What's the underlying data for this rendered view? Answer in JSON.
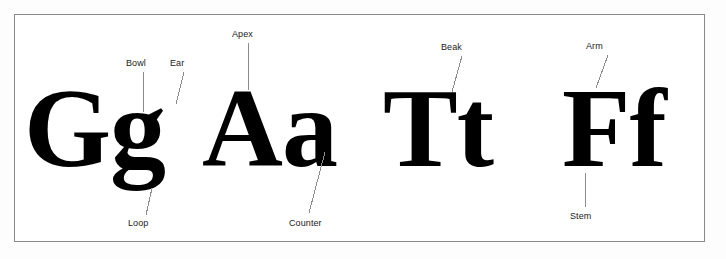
{
  "diagram": {
    "background_color": "#ffffff",
    "frame_color": "#8a8a8a",
    "glyph_color": "#000000",
    "label_color": "#1a1a1a",
    "leader_line_color": "#8c8c8c",
    "typeface_style": "bold serif"
  },
  "glyph_pairs": [
    {
      "name": "pair-gg",
      "text": "Gg",
      "left": 24,
      "baseline": 172,
      "size": 112
    },
    {
      "name": "pair-aa",
      "text": "Aa",
      "left": 202,
      "baseline": 172,
      "size": 112
    },
    {
      "name": "pair-tt",
      "text": "Tt",
      "left": 383,
      "baseline": 172,
      "size": 112
    },
    {
      "name": "pair-ff",
      "text": "Ff",
      "left": 562,
      "baseline": 172,
      "size": 112
    }
  ],
  "callouts": [
    {
      "name": "bowl",
      "label": "Bowl",
      "label_x": 126,
      "label_y": 58,
      "line": {
        "x1": 143,
        "y1": 72,
        "x2": 143,
        "y2": 112
      }
    },
    {
      "name": "ear",
      "label": "Ear",
      "label_x": 170,
      "label_y": 58,
      "line": {
        "x1": 184,
        "y1": 72,
        "x2": 176,
        "y2": 104
      }
    },
    {
      "name": "apex",
      "label": "Apex",
      "label_x": 232,
      "label_y": 29,
      "line": {
        "x1": 248,
        "y1": 43,
        "x2": 248,
        "y2": 90
      }
    },
    {
      "name": "beak",
      "label": "Beak",
      "label_x": 441,
      "label_y": 42,
      "line": {
        "x1": 462,
        "y1": 56,
        "x2": 452,
        "y2": 92
      }
    },
    {
      "name": "arm",
      "label": "Arm",
      "label_x": 586,
      "label_y": 41,
      "line": {
        "x1": 608,
        "y1": 55,
        "x2": 596,
        "y2": 88
      }
    },
    {
      "name": "loop",
      "label": "Loop",
      "label_x": 128,
      "label_y": 218,
      "line": {
        "x1": 146,
        "y1": 215,
        "x2": 152,
        "y2": 188
      }
    },
    {
      "name": "counter",
      "label": "Counter",
      "label_x": 289,
      "label_y": 218,
      "line": {
        "x1": 309,
        "y1": 213,
        "x2": 325,
        "y2": 152
      }
    },
    {
      "name": "stem",
      "label": "Stem",
      "label_x": 570,
      "label_y": 211,
      "line": {
        "x1": 585,
        "y1": 207,
        "x2": 585,
        "y2": 173
      }
    }
  ]
}
